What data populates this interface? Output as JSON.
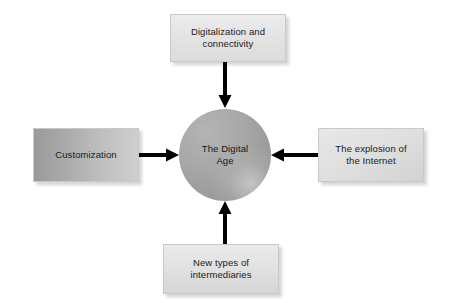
{
  "diagram": {
    "center": {
      "name": "center-node",
      "label": "The Digital\nAge",
      "shape": "circle",
      "fill_color": "#a5a5a5"
    },
    "nodes": [
      {
        "id": "top",
        "label": "Digitalization and\nconnectivity",
        "position": "top",
        "fill_color": "#e4e4e4"
      },
      {
        "id": "left",
        "label": "Customization",
        "position": "left",
        "fill_color": "#aaaaaa"
      },
      {
        "id": "right",
        "label": "The explosion of\nthe Internet",
        "position": "right",
        "fill_color": "#dedede"
      },
      {
        "id": "bottom",
        "label": "New types of\nintermediaries",
        "position": "bottom",
        "fill_color": "#e1e1e1"
      }
    ],
    "arrows": [
      {
        "id": "top",
        "direction": "down",
        "color": "#000000"
      },
      {
        "id": "left",
        "direction": "right",
        "color": "#000000"
      },
      {
        "id": "right",
        "direction": "left",
        "color": "#000000"
      },
      {
        "id": "bottom",
        "direction": "up",
        "color": "#000000"
      }
    ],
    "background_color": "#ffffff"
  }
}
